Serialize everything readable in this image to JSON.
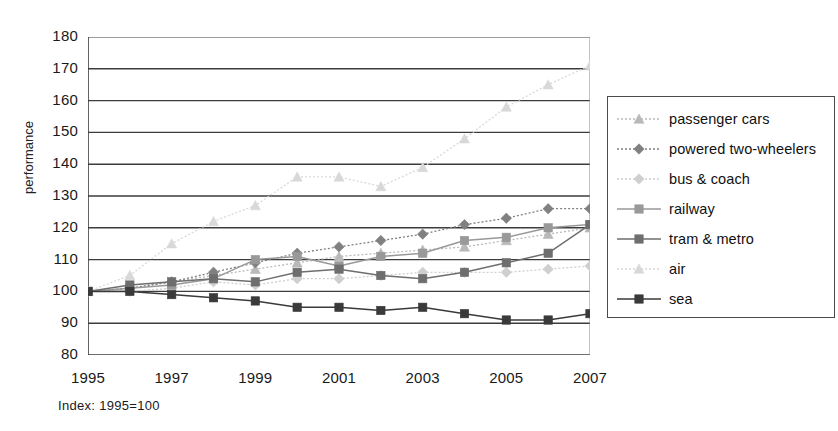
{
  "axes": {
    "ylabel": "performance",
    "yticks": [
      "180",
      "170",
      "160",
      "150",
      "140",
      "130",
      "120",
      "110",
      "100",
      "90",
      "80"
    ],
    "xticks": [
      "1995",
      "1997",
      "1999",
      "2001",
      "2003",
      "2005",
      "2007"
    ]
  },
  "footnote": "Index: 1995=100",
  "legend": {
    "items": [
      {
        "label": "passenger cars",
        "color": "#b9b9b9",
        "marker": "triangle",
        "dash": "dotted"
      },
      {
        "label": "powered two-wheelers",
        "color": "#808080",
        "marker": "diamond",
        "dash": "dotted"
      },
      {
        "label": "bus & coach",
        "color": "#cfcfcf",
        "marker": "diamond",
        "dash": "dotted"
      },
      {
        "label": "railway",
        "color": "#999999",
        "marker": "square",
        "dash": "solid"
      },
      {
        "label": "tram & metro",
        "color": "#6e6e6e",
        "marker": "square",
        "dash": "solid"
      },
      {
        "label": "air",
        "color": "#d8d8d8",
        "marker": "triangle",
        "dash": "dotted"
      },
      {
        "label": "sea",
        "color": "#3a3a3a",
        "marker": "square",
        "dash": "solid"
      }
    ]
  },
  "chart_data": {
    "type": "line",
    "title": "",
    "xlabel": "",
    "ylabel": "performance",
    "annotation": "Index: 1995=100",
    "xlim": [
      1995,
      2007
    ],
    "ylim": [
      80,
      180
    ],
    "ytick_step": 10,
    "grid": true,
    "legend_position": "right",
    "x": [
      1995,
      1996,
      1997,
      1998,
      1999,
      2000,
      2001,
      2002,
      2003,
      2004,
      2005,
      2006,
      2007
    ],
    "series": [
      {
        "name": "passenger cars",
        "color": "#b9b9b9",
        "marker": "triangle",
        "values": [
          100,
          101,
          103,
          105,
          107,
          109,
          111,
          112,
          113,
          114,
          116,
          118,
          120
        ]
      },
      {
        "name": "powered two-wheelers",
        "color": "#808080",
        "marker": "diamond",
        "values": [
          100,
          101,
          103,
          106,
          109,
          112,
          114,
          116,
          118,
          121,
          123,
          126,
          126
        ]
      },
      {
        "name": "bus & coach",
        "color": "#cfcfcf",
        "marker": "diamond",
        "values": [
          100,
          100,
          101,
          103,
          102,
          104,
          104,
          105,
          106,
          106,
          106,
          107,
          108
        ]
      },
      {
        "name": "railway",
        "color": "#999999",
        "marker": "square",
        "values": [
          100,
          101,
          102,
          104,
          110,
          111,
          108,
          111,
          112,
          116,
          117,
          120,
          121
        ]
      },
      {
        "name": "tram & metro",
        "color": "#6e6e6e",
        "marker": "square",
        "values": [
          100,
          102,
          103,
          104,
          103,
          106,
          107,
          105,
          104,
          106,
          109,
          112,
          121
        ]
      },
      {
        "name": "air",
        "color": "#d8d8d8",
        "marker": "triangle",
        "values": [
          100,
          105,
          115,
          122,
          127,
          136,
          136,
          133,
          139,
          148,
          158,
          165,
          171
        ]
      },
      {
        "name": "sea",
        "color": "#3a3a3a",
        "marker": "square",
        "values": [
          100,
          100,
          99,
          98,
          97,
          95,
          95,
          94,
          95,
          93,
          91,
          91,
          93
        ]
      }
    ]
  }
}
